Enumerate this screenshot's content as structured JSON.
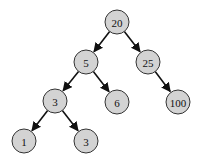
{
  "diagram": {
    "type": "binary-tree",
    "node_fill": "#d3d3d3",
    "node_stroke": "#333333",
    "edge_color": "#111111",
    "nodes": [
      {
        "id": "n20",
        "label": "20",
        "x": 117,
        "y": 22
      },
      {
        "id": "n5",
        "label": "5",
        "x": 86,
        "y": 62
      },
      {
        "id": "n25",
        "label": "25",
        "x": 148,
        "y": 62
      },
      {
        "id": "n3a",
        "label": "3",
        "x": 55,
        "y": 101
      },
      {
        "id": "n6",
        "label": "6",
        "x": 117,
        "y": 102
      },
      {
        "id": "n100",
        "label": "100",
        "x": 178,
        "y": 102
      },
      {
        "id": "n1",
        "label": "1",
        "x": 24,
        "y": 141
      },
      {
        "id": "n3b",
        "label": "3",
        "x": 86,
        "y": 141
      }
    ],
    "edges": [
      {
        "from": "n20",
        "to": "n5"
      },
      {
        "from": "n20",
        "to": "n25"
      },
      {
        "from": "n5",
        "to": "n3a"
      },
      {
        "from": "n5",
        "to": "n6"
      },
      {
        "from": "n25",
        "to": "n100"
      },
      {
        "from": "n3a",
        "to": "n1"
      },
      {
        "from": "n3a",
        "to": "n3b"
      }
    ]
  }
}
